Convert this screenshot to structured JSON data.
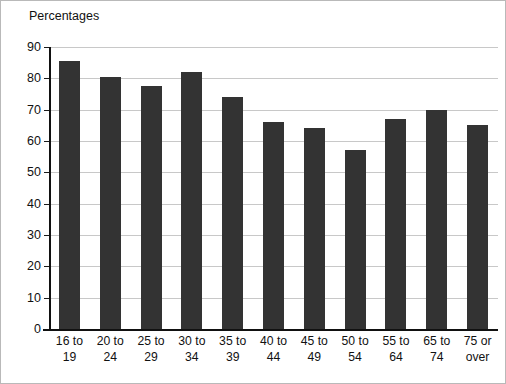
{
  "chart_data": {
    "type": "bar",
    "title": "",
    "ylabel": "Percentages",
    "xlabel": "",
    "ylim": [
      0,
      90
    ],
    "ytick_step": 10,
    "yticks": [
      "90",
      "80",
      "70",
      "60",
      "50",
      "40",
      "30",
      "20",
      "10",
      "0"
    ],
    "grid": true,
    "legend": null,
    "bar_color": "#333333",
    "gridline_color": "#c8c8c8",
    "axis_color": "#111111",
    "background_color": "#ffffff",
    "categories": [
      "16 to 19",
      "20 to 24",
      "25 to 29",
      "30 to 34",
      "35 to 39",
      "40 to 44",
      "45 to 49",
      "50 to 54",
      "55 to 64",
      "65 to 74",
      "75 or over"
    ],
    "category_lines": [
      [
        "16 to",
        "19"
      ],
      [
        "20 to",
        "24"
      ],
      [
        "25 to",
        "29"
      ],
      [
        "30 to",
        "34"
      ],
      [
        "35 to",
        "39"
      ],
      [
        "40 to",
        "44"
      ],
      [
        "45 to",
        "49"
      ],
      [
        "50 to",
        "54"
      ],
      [
        "55 to",
        "64"
      ],
      [
        "65 to",
        "74"
      ],
      [
        "75 or",
        "over"
      ]
    ],
    "values": [
      85.5,
      80.5,
      77.5,
      82,
      74,
      66,
      64,
      57,
      67,
      70,
      65
    ]
  }
}
